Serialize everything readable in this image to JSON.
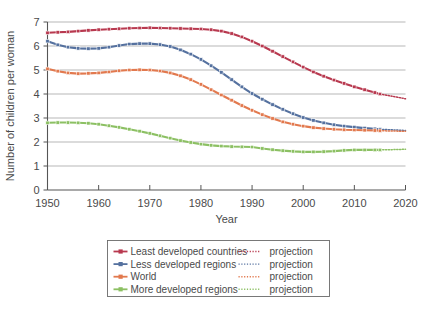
{
  "figure": {
    "background_color": "#ffffff",
    "width": 432,
    "height": 318
  },
  "chart_data": {
    "type": "line",
    "title": "",
    "xlabel": "Year",
    "ylabel": "Number of children per woman",
    "xlim": [
      1950,
      2020
    ],
    "ylim": [
      0,
      7
    ],
    "xticks": [
      1950,
      1960,
      1970,
      1980,
      1990,
      2000,
      2010,
      2020
    ],
    "yticks": [
      0,
      1,
      2,
      3,
      4,
      5,
      6,
      7
    ],
    "grid": "horizontal",
    "legend_position": "below-axes",
    "x": [
      1950,
      1952,
      1954,
      1956,
      1958,
      1960,
      1962,
      1964,
      1966,
      1968,
      1970,
      1972,
      1974,
      1976,
      1978,
      1980,
      1982,
      1984,
      1986,
      1988,
      1990,
      1992,
      1994,
      1996,
      1998,
      2000,
      2002,
      2004,
      2006,
      2008,
      2010,
      2012,
      2014,
      2015
    ],
    "x_projection": [
      2015,
      2016,
      2017,
      2018,
      2019,
      2020
    ],
    "series": [
      {
        "name": "Least developed countries",
        "color": "#b8394f",
        "values": [
          6.55,
          6.57,
          6.59,
          6.62,
          6.65,
          6.68,
          6.7,
          6.72,
          6.74,
          6.75,
          6.76,
          6.75,
          6.74,
          6.73,
          6.72,
          6.71,
          6.68,
          6.62,
          6.52,
          6.38,
          6.2,
          6.0,
          5.78,
          5.56,
          5.34,
          5.12,
          4.92,
          4.74,
          4.58,
          4.44,
          4.3,
          4.18,
          4.06,
          4.0
        ],
        "projection_values": [
          4.0,
          3.96,
          3.92,
          3.88,
          3.84,
          3.8
        ],
        "projection_label": "projection"
      },
      {
        "name": "Less developed regions",
        "color": "#55719f",
        "values": [
          6.2,
          6.05,
          5.95,
          5.9,
          5.89,
          5.9,
          5.95,
          6.02,
          6.08,
          6.1,
          6.1,
          6.06,
          5.98,
          5.84,
          5.66,
          5.44,
          5.18,
          4.9,
          4.6,
          4.3,
          4.02,
          3.78,
          3.56,
          3.36,
          3.18,
          3.02,
          2.9,
          2.8,
          2.72,
          2.66,
          2.62,
          2.58,
          2.55,
          2.53
        ],
        "projection_values": [
          2.53,
          2.52,
          2.51,
          2.5,
          2.49,
          2.48
        ],
        "projection_label": "projection"
      },
      {
        "name": "World",
        "color": "#e2794e",
        "values": [
          5.05,
          4.95,
          4.88,
          4.85,
          4.86,
          4.88,
          4.92,
          4.97,
          5.0,
          5.01,
          5.0,
          4.96,
          4.88,
          4.76,
          4.6,
          4.4,
          4.18,
          3.96,
          3.74,
          3.52,
          3.32,
          3.14,
          2.98,
          2.84,
          2.74,
          2.66,
          2.6,
          2.56,
          2.53,
          2.51,
          2.5,
          2.49,
          2.48,
          2.47
        ],
        "projection_values": [
          2.47,
          2.465,
          2.46,
          2.455,
          2.45,
          2.45
        ],
        "projection_label": "projection"
      },
      {
        "name": "More developed regions",
        "color": "#8cc063",
        "values": [
          2.8,
          2.81,
          2.81,
          2.8,
          2.78,
          2.74,
          2.68,
          2.61,
          2.53,
          2.45,
          2.36,
          2.26,
          2.16,
          2.06,
          1.98,
          1.91,
          1.86,
          1.83,
          1.81,
          1.8,
          1.79,
          1.73,
          1.68,
          1.64,
          1.61,
          1.59,
          1.59,
          1.6,
          1.62,
          1.65,
          1.67,
          1.67,
          1.67,
          1.67
        ],
        "projection_values": [
          1.67,
          1.675,
          1.68,
          1.685,
          1.69,
          1.7
        ],
        "projection_label": "projection"
      }
    ]
  },
  "legend": {
    "rows": [
      {
        "label": "Least developed countries",
        "projection_label": "projection",
        "color": "#b8394f"
      },
      {
        "label": "Less developed regions",
        "projection_label": "projection",
        "color": "#55719f"
      },
      {
        "label": "World",
        "projection_label": "projection",
        "color": "#e2794e"
      },
      {
        "label": "More developed regions",
        "projection_label": "projection",
        "color": "#8cc063"
      }
    ]
  }
}
